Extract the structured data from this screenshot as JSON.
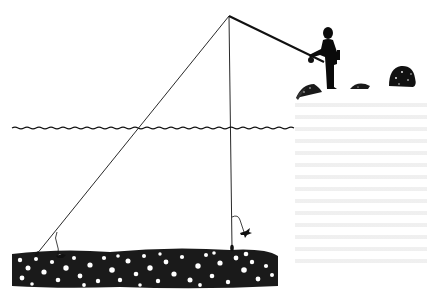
{
  "figure": {
    "colors": {
      "ink": "#111111",
      "background": "#ffffff",
      "bleed_through": "#d8d8d8"
    },
    "elements": {
      "angler": "silhouette of person holding fishing rod",
      "rod": "fishing rod extending to tip",
      "water_surface": "wavy line",
      "line_left": "diagonal line to bottom with weight and dropper",
      "line_right": "vertical line to bottom with weight and dropper",
      "bottom": "rocky / gravel stream bed",
      "bank": "grassy bank with bushes"
    }
  }
}
